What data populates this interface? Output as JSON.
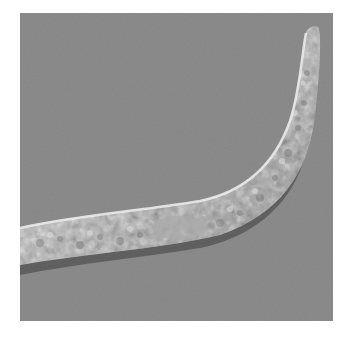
{
  "image": {
    "subject": "nematode worm, DIC micrograph",
    "colors": {
      "background": "#8c8c8c",
      "body": "#b8b8b8",
      "highlight": "#e6e6e6",
      "shadow": "#4a4a4a",
      "border": "#ffffff"
    }
  }
}
